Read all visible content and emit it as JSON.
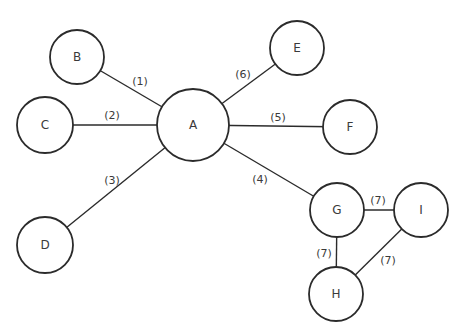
{
  "diagram": {
    "type": "graph",
    "nodes": [
      {
        "id": "A",
        "label": "A",
        "cx": 193,
        "cy": 125,
        "r": 36
      },
      {
        "id": "B",
        "label": "B",
        "cx": 77,
        "cy": 57,
        "r": 27
      },
      {
        "id": "C",
        "label": "C",
        "cx": 45,
        "cy": 125,
        "r": 28
      },
      {
        "id": "D",
        "label": "D",
        "cx": 45,
        "cy": 245,
        "r": 28
      },
      {
        "id": "E",
        "label": "E",
        "cx": 297,
        "cy": 48,
        "r": 27
      },
      {
        "id": "F",
        "label": "F",
        "cx": 350,
        "cy": 127,
        "r": 27
      },
      {
        "id": "G",
        "label": "G",
        "cx": 337,
        "cy": 210,
        "r": 27
      },
      {
        "id": "I",
        "label": "I",
        "cx": 421,
        "cy": 210,
        "r": 27
      },
      {
        "id": "H",
        "label": "H",
        "cx": 336,
        "cy": 294,
        "r": 27
      }
    ],
    "edges": [
      {
        "from": "A",
        "to": "B",
        "label": "(1)",
        "lx": 140,
        "ly": 81
      },
      {
        "from": "A",
        "to": "C",
        "label": "(2)",
        "lx": 112,
        "ly": 115
      },
      {
        "from": "A",
        "to": "D",
        "label": "(3)",
        "lx": 112,
        "ly": 180
      },
      {
        "from": "A",
        "to": "G",
        "label": "(4)",
        "lx": 260,
        "ly": 179
      },
      {
        "from": "A",
        "to": "F",
        "label": "(5)",
        "lx": 278,
        "ly": 117
      },
      {
        "from": "A",
        "to": "E",
        "label": "(6)",
        "lx": 243,
        "ly": 74
      },
      {
        "from": "G",
        "to": "I",
        "label": "(7)",
        "lx": 378,
        "ly": 200
      },
      {
        "from": "G",
        "to": "H",
        "label": "(7)",
        "lx": 324,
        "ly": 253
      },
      {
        "from": "H",
        "to": "I",
        "label": "(7)",
        "lx": 388,
        "ly": 260
      }
    ],
    "colors": {
      "stroke": "#2b2b2b",
      "text": "#3a3a3a",
      "background": "#ffffff"
    }
  }
}
